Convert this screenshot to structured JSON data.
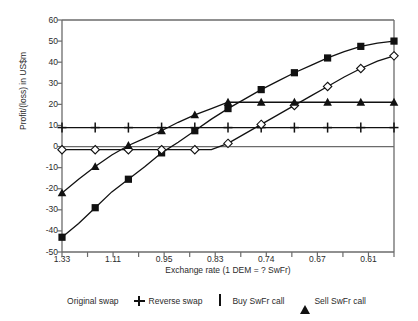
{
  "chart_data": {
    "type": "line",
    "title": "",
    "xlabel": "Exchange rate (1 DEM = ? SwFr)",
    "ylabel": "Profit/(loss) in US$m",
    "x": [
      1.33,
      1.25,
      1.18,
      1.11,
      1.05,
      1.0,
      0.95,
      0.91,
      0.87,
      0.83,
      0.8,
      0.77,
      0.74,
      0.71,
      0.69,
      0.67,
      0.65,
      0.63,
      0.61,
      0.59,
      0.58
    ],
    "tick_labels": [
      "1.33",
      "",
      "1.11",
      "",
      "0.95",
      "",
      "0.83",
      "",
      "0.74",
      "",
      "0.67",
      "",
      "0.61",
      ""
    ],
    "xtick_labels_major": [
      "1.33",
      "1.11",
      "0.95",
      "0.83",
      "0.74",
      "0.67",
      "0.61"
    ],
    "ylim": [
      -50,
      60
    ],
    "ytick_labels": [
      "60",
      "50",
      "40",
      "30",
      "20",
      "10",
      "0",
      "-10",
      "-20",
      "-30",
      "-40",
      "-50"
    ],
    "ytick_values": [
      60,
      50,
      40,
      30,
      20,
      10,
      0,
      -10,
      -20,
      -30,
      -40,
      -50
    ],
    "grid": false,
    "legend_position": "bottom",
    "series": [
      {
        "name": "Original swap",
        "marker": "square",
        "values": [
          -43,
          -36.5,
          -29,
          -21.5,
          -15.5,
          -9.5,
          -3,
          2,
          7.5,
          13,
          18,
          22.5,
          27,
          31,
          35,
          38.5,
          42,
          45,
          47.5,
          49,
          50
        ]
      },
      {
        "name": "Reverse swap",
        "marker": "plus",
        "values": [
          9,
          9,
          9,
          9,
          9,
          9,
          9,
          9,
          9,
          9,
          9,
          9,
          9,
          9,
          9,
          9,
          9,
          9,
          9,
          9,
          9
        ]
      },
      {
        "name": "Buy SwFr call",
        "marker": "diamond",
        "values": [
          -1.5,
          -1.5,
          -1.5,
          -1.5,
          -1.5,
          -1.5,
          -1.5,
          -1.5,
          -1.5,
          -1.5,
          1.5,
          6,
          10.5,
          15,
          19.5,
          24,
          28.5,
          33,
          37,
          40.5,
          43
        ]
      },
      {
        "name": "Sell SwFr call",
        "marker": "triangle",
        "values": [
          -22,
          -15.5,
          -9.5,
          -4,
          0.5,
          4,
          7.5,
          11.5,
          15,
          18,
          21,
          21,
          21,
          21,
          21,
          21,
          21,
          21,
          21,
          21,
          21
        ]
      }
    ]
  },
  "legend": {
    "items": [
      {
        "label": "Original swap",
        "marker": "square"
      },
      {
        "label": "Reverse swap",
        "marker": "plus"
      },
      {
        "label": "Buy SwFr call",
        "marker": "diamond"
      },
      {
        "label": "Sell SwFr call",
        "marker": "triangle"
      }
    ]
  },
  "colors": {
    "ink": "#111111",
    "axis": "#6b6b6b",
    "background": "#ffffff"
  }
}
